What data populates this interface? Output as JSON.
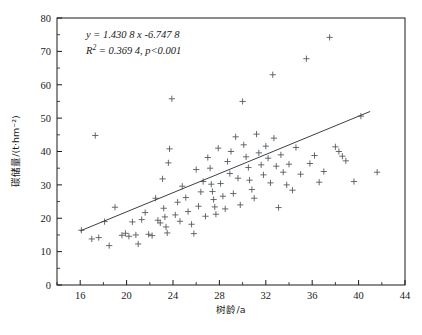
{
  "chart_data": {
    "type": "scatter",
    "title": "",
    "xlabel": "树龄/a",
    "ylabel": "碳储量/(t·hm⁻²)",
    "xlim": [
      14,
      44
    ],
    "ylim": [
      0,
      80
    ],
    "xticks": [
      16,
      20,
      24,
      28,
      32,
      36,
      40,
      44
    ],
    "yticks": [
      0,
      10,
      20,
      30,
      40,
      50,
      60,
      70,
      80
    ],
    "xtick_minor_step": 2,
    "ytick_minor_step": 5,
    "grid": false,
    "legend": null,
    "marker": "plus",
    "marker_color": "#555a5f",
    "line_color": "#3c4045",
    "annotations": {
      "equation_line1": "y = 1.430 8 x -6.747 8",
      "equation_line2": "R² = 0.369 4, p<0.001",
      "slope": 1.4308,
      "intercept": -6.7478,
      "r_squared": 0.3694,
      "p_value": "<0.001"
    },
    "fit_line": {
      "x_start": 16.0,
      "y_start": 16.2,
      "x_end": 41.0,
      "y_end": 52.0
    },
    "points": [
      [
        16.1,
        16.4
      ],
      [
        17.0,
        13.8
      ],
      [
        17.3,
        44.8
      ],
      [
        17.6,
        14.2
      ],
      [
        18.1,
        19.0
      ],
      [
        18.5,
        11.8
      ],
      [
        19.0,
        23.3
      ],
      [
        19.6,
        14.9
      ],
      [
        19.9,
        15.5
      ],
      [
        20.2,
        14.6
      ],
      [
        20.5,
        18.9
      ],
      [
        20.8,
        15.0
      ],
      [
        21.0,
        12.3
      ],
      [
        21.3,
        19.6
      ],
      [
        21.6,
        21.7
      ],
      [
        21.9,
        15.2
      ],
      [
        22.2,
        14.8
      ],
      [
        22.5,
        26.0
      ],
      [
        22.7,
        19.4
      ],
      [
        22.9,
        18.6
      ],
      [
        23.1,
        31.8
      ],
      [
        23.2,
        23.0
      ],
      [
        23.3,
        20.4
      ],
      [
        23.4,
        17.4
      ],
      [
        23.5,
        15.6
      ],
      [
        23.6,
        36.6
      ],
      [
        23.7,
        40.8
      ],
      [
        23.9,
        55.8
      ],
      [
        24.2,
        21.0
      ],
      [
        24.4,
        24.8
      ],
      [
        24.6,
        19.1
      ],
      [
        24.8,
        29.6
      ],
      [
        25.1,
        26.2
      ],
      [
        25.3,
        22.0
      ],
      [
        25.6,
        18.2
      ],
      [
        25.8,
        15.4
      ],
      [
        26.0,
        34.6
      ],
      [
        26.2,
        23.6
      ],
      [
        26.4,
        27.9
      ],
      [
        26.6,
        31.0
      ],
      [
        26.8,
        20.6
      ],
      [
        27.0,
        38.2
      ],
      [
        27.2,
        35.0
      ],
      [
        27.3,
        30.2
      ],
      [
        27.4,
        28.0
      ],
      [
        27.5,
        25.6
      ],
      [
        27.6,
        23.4
      ],
      [
        27.7,
        21.2
      ],
      [
        27.9,
        41.0
      ],
      [
        28.1,
        30.4
      ],
      [
        28.3,
        26.6
      ],
      [
        28.5,
        22.8
      ],
      [
        28.7,
        37.0
      ],
      [
        28.9,
        33.4
      ],
      [
        29.0,
        40.0
      ],
      [
        29.2,
        27.4
      ],
      [
        29.4,
        44.4
      ],
      [
        29.6,
        32.0
      ],
      [
        29.8,
        24.0
      ],
      [
        30.0,
        55.0
      ],
      [
        30.1,
        42.0
      ],
      [
        30.3,
        38.4
      ],
      [
        30.5,
        35.2
      ],
      [
        30.6,
        31.4
      ],
      [
        30.8,
        28.6
      ],
      [
        31.0,
        26.0
      ],
      [
        31.2,
        45.2
      ],
      [
        31.4,
        39.6
      ],
      [
        31.6,
        36.0
      ],
      [
        31.8,
        33.0
      ],
      [
        32.0,
        41.6
      ],
      [
        32.2,
        38.0
      ],
      [
        32.4,
        30.6
      ],
      [
        32.6,
        63.0
      ],
      [
        32.7,
        44.0
      ],
      [
        32.9,
        35.6
      ],
      [
        33.1,
        23.2
      ],
      [
        33.3,
        39.0
      ],
      [
        33.5,
        33.8
      ],
      [
        33.8,
        30.0
      ],
      [
        34.0,
        36.2
      ],
      [
        34.3,
        28.4
      ],
      [
        34.6,
        41.2
      ],
      [
        35.0,
        33.2
      ],
      [
        35.5,
        67.8
      ],
      [
        35.8,
        36.4
      ],
      [
        36.2,
        38.8
      ],
      [
        36.6,
        30.8
      ],
      [
        37.0,
        34.0
      ],
      [
        37.5,
        74.2
      ],
      [
        38.0,
        41.4
      ],
      [
        38.3,
        40.0
      ],
      [
        38.6,
        38.6
      ],
      [
        38.9,
        37.2
      ],
      [
        39.6,
        31.0
      ],
      [
        40.2,
        50.6
      ],
      [
        41.6,
        33.8
      ]
    ]
  }
}
